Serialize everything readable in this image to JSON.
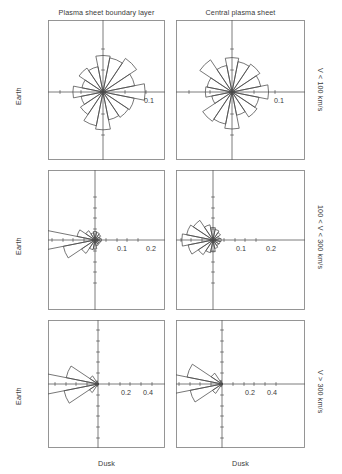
{
  "figure": {
    "column_titles": [
      "Plasma sheet boundary layer",
      "Central plasma sheet"
    ],
    "row_labels": [
      "V < 100 km/s",
      "100 < V < 300 km/s",
      "V > 300 km/s"
    ],
    "left_labels": [
      "Earth",
      "Earth",
      "Earth"
    ],
    "bottom_labels": [
      "Dusk",
      "Dusk"
    ],
    "line_color": "#4a4a4a",
    "axis_color": "#5a5a5a",
    "frame_color": "#8a8a8a",
    "text_color": "#3a3a3a"
  },
  "chart_data": [
    {
      "type": "pie",
      "title": "Plasma sheet boundary layer, V < 100 km/s",
      "subtitle": "",
      "panel": "row1-col1",
      "xlabel": "Dusk",
      "ylabel": "Earth",
      "axis_tick_label": "0.1",
      "tick_values": [
        0.05,
        0.1
      ],
      "radial_max": 0.135,
      "grid": false,
      "legend": "none",
      "bin_width_deg": 22.5,
      "categories": [
        0,
        22.5,
        45,
        67.5,
        90,
        112.5,
        135,
        157.5,
        180,
        202.5,
        225,
        247.5,
        270,
        292.5,
        315,
        337.5
      ],
      "values": [
        0.098,
        0.075,
        0.094,
        0.081,
        0.085,
        0.06,
        0.067,
        0.05,
        0.07,
        0.052,
        0.063,
        0.08,
        0.088,
        0.066,
        0.071,
        0.074
      ]
    },
    {
      "type": "pie",
      "title": "Central plasma sheet, V < 100 km/s",
      "subtitle": "",
      "panel": "row1-col2",
      "xlabel": "Dusk",
      "ylabel": "Earth",
      "axis_tick_label": "0.1",
      "tick_values": [
        0.05,
        0.1
      ],
      "radial_max": 0.125,
      "grid": false,
      "legend": "none",
      "bin_width_deg": 22.5,
      "categories": [
        0,
        22.5,
        45,
        67.5,
        90,
        112.5,
        135,
        157.5,
        180,
        202.5,
        225,
        247.5,
        270,
        292.5,
        315,
        337.5
      ],
      "values": [
        0.085,
        0.068,
        0.078,
        0.072,
        0.08,
        0.063,
        0.09,
        0.059,
        0.062,
        0.048,
        0.082,
        0.076,
        0.086,
        0.055,
        0.07,
        0.064
      ]
    },
    {
      "type": "pie",
      "title": "Plasma sheet boundary layer, 100 < V < 300 km/s",
      "subtitle": "",
      "panel": "row2-col1",
      "xlabel": "Dusk",
      "ylabel": "Earth",
      "axis_tick_labels": [
        "0.1",
        "0.2"
      ],
      "tick_values": [
        0.05,
        0.1,
        0.15,
        0.2
      ],
      "radial_max": 0.27,
      "grid": false,
      "legend": "none",
      "bin_width_deg": 22.5,
      "categories": [
        0,
        22.5,
        45,
        67.5,
        90,
        112.5,
        135,
        157.5,
        180,
        202.5,
        225,
        247.5,
        270,
        292.5,
        315,
        337.5
      ],
      "values": [
        0.03,
        0.025,
        0.032,
        0.036,
        0.04,
        0.034,
        0.052,
        0.085,
        0.255,
        0.15,
        0.075,
        0.046,
        0.042,
        0.028,
        0.024,
        0.026
      ]
    },
    {
      "type": "pie",
      "title": "Central plasma sheet, 100 < V < 300 km/s",
      "subtitle": "",
      "panel": "row2-col2",
      "xlabel": "Dusk",
      "ylabel": "Earth",
      "axis_tick_labels": [
        "0.1",
        "0.2"
      ],
      "tick_values": [
        0.05,
        0.1,
        0.15,
        0.2
      ],
      "radial_max": 0.2,
      "grid": false,
      "legend": "none",
      "bin_width_deg": 22.5,
      "categories": [
        0,
        22.5,
        45,
        67.5,
        90,
        112.5,
        135,
        157.5,
        180,
        202.5,
        225,
        247.5,
        270,
        292.5,
        315,
        337.5
      ],
      "values": [
        0.038,
        0.03,
        0.042,
        0.05,
        0.058,
        0.072,
        0.11,
        0.125,
        0.145,
        0.118,
        0.082,
        0.06,
        0.055,
        0.04,
        0.032,
        0.034
      ]
    },
    {
      "type": "pie",
      "title": "Plasma sheet boundary layer, V > 300 km/s",
      "subtitle": "",
      "panel": "row3-col1",
      "xlabel": "Dusk",
      "ylabel": "Earth",
      "axis_tick_labels": [
        "0.2",
        "0.4"
      ],
      "tick_values": [
        0.1,
        0.2,
        0.3,
        0.4,
        0.5
      ],
      "radial_max": 0.58,
      "grid": false,
      "legend": "none",
      "bin_width_deg": 22.5,
      "categories": [
        0,
        22.5,
        45,
        67.5,
        90,
        112.5,
        135,
        157.5,
        180,
        202.5,
        225,
        247.5,
        270,
        292.5,
        315,
        337.5
      ],
      "values": [
        0.004,
        0.003,
        0.004,
        0.006,
        0.008,
        0.03,
        0.09,
        0.3,
        0.56,
        0.32,
        0.095,
        0.022,
        0.01,
        0.005,
        0.004,
        0.003
      ]
    },
    {
      "type": "pie",
      "title": "Central plasma sheet, V > 300 km/s",
      "subtitle": "",
      "panel": "row3-col2",
      "xlabel": "Dusk",
      "ylabel": "Earth",
      "axis_tick_labels": [
        "0.2",
        "0.4"
      ],
      "tick_values": [
        0.1,
        0.2,
        0.3,
        0.4,
        0.5
      ],
      "radial_max": 0.56,
      "grid": false,
      "legend": "none",
      "bin_width_deg": 22.5,
      "categories": [
        0,
        22.5,
        45,
        67.5,
        90,
        112.5,
        135,
        157.5,
        180,
        202.5,
        225,
        247.5,
        270,
        292.5,
        315,
        337.5
      ],
      "values": [
        0.004,
        0.003,
        0.005,
        0.007,
        0.01,
        0.035,
        0.12,
        0.33,
        0.54,
        0.3,
        0.105,
        0.026,
        0.011,
        0.005,
        0.004,
        0.003
      ]
    }
  ],
  "panel_geometry": [
    {
      "x": 48,
      "y": 20,
      "w": 117,
      "h": 140,
      "cx": 55,
      "cy": 72,
      "scale": 430,
      "ticks_px": [
        22,
        43
      ],
      "label_positions": [
        {
          "text": "0.1",
          "x": 101,
          "y": 83
        }
      ]
    },
    {
      "x": 176,
      "y": 20,
      "w": 129,
      "h": 140,
      "cx": 56,
      "cy": 72,
      "scale": 430,
      "ticks_px": [
        22,
        43
      ],
      "label_positions": [
        {
          "text": "0.1",
          "x": 103,
          "y": 83
        }
      ]
    },
    {
      "x": 48,
      "y": 170,
      "w": 117,
      "h": 140,
      "cx": 47,
      "cy": 70,
      "scale": 215,
      "ticks_px": [
        11,
        22,
        32,
        43
      ],
      "label_positions": [
        {
          "text": "0.1",
          "x": 74,
          "y": 81
        },
        {
          "text": "0.2",
          "x": 103,
          "y": 81
        }
      ]
    },
    {
      "x": 176,
      "y": 170,
      "w": 129,
      "h": 140,
      "cx": 37,
      "cy": 70,
      "scale": 215,
      "ticks_px": [
        11,
        22,
        32,
        43
      ],
      "label_positions": [
        {
          "text": "0.1",
          "x": 65,
          "y": 81
        },
        {
          "text": "0.2",
          "x": 95,
          "y": 81
        }
      ]
    },
    {
      "x": 48,
      "y": 320,
      "w": 117,
      "h": 128,
      "cx": 50,
      "cy": 64,
      "scale": 108,
      "ticks_px": [
        11,
        22,
        32,
        43,
        54
      ],
      "label_positions": [
        {
          "text": "0.2",
          "x": 78,
          "y": 75
        },
        {
          "text": "0.4",
          "x": 100,
          "y": 75
        }
      ]
    },
    {
      "x": 176,
      "y": 320,
      "w": 129,
      "h": 128,
      "cx": 46,
      "cy": 64,
      "scale": 108,
      "ticks_px": [
        11,
        22,
        32,
        43,
        54
      ],
      "label_positions": [
        {
          "text": "0.2",
          "x": 74,
          "y": 75
        },
        {
          "text": "0.4",
          "x": 96,
          "y": 75
        }
      ]
    }
  ]
}
